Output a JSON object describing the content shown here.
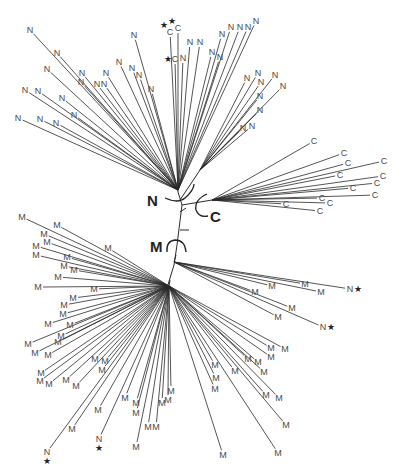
{
  "diagram": {
    "type": "unrooted phylogenetic tree",
    "clade_labels": [
      {
        "label": "N",
        "x": 147,
        "y": 206
      },
      {
        "label": "C",
        "x": 210,
        "y": 222
      },
      {
        "label": "M",
        "x": 152,
        "y": 252
      }
    ],
    "trunk": [
      [
        178,
        192
      ],
      [
        182,
        205
      ],
      [
        177,
        245
      ],
      [
        174,
        265
      ],
      [
        167,
        288
      ]
    ],
    "hubs": {
      "N_upper": {
        "x": 178,
        "y": 190
      },
      "N_right": {
        "x": 200,
        "y": 170
      },
      "C": {
        "x": 212,
        "y": 200
      },
      "M_upper": {
        "x": 169,
        "y": 286
      },
      "M_right": {
        "x": 174,
        "y": 262
      }
    },
    "leaves": [
      {
        "label": "N",
        "x": 30,
        "y": 30,
        "hub": "N_upper"
      },
      {
        "label": "N",
        "x": 57,
        "y": 53,
        "hub": "N_upper"
      },
      {
        "label": "N",
        "x": 47,
        "y": 69,
        "hub": "N_upper"
      },
      {
        "label": "N",
        "x": 82,
        "y": 73,
        "hub": "N_upper"
      },
      {
        "label": "N",
        "x": 81,
        "y": 82,
        "hub": "N_upper"
      },
      {
        "label": "N",
        "x": 106,
        "y": 73,
        "hub": "N_upper"
      },
      {
        "label": "N",
        "x": 97,
        "y": 84,
        "hub": "N_upper"
      },
      {
        "label": "N",
        "x": 104,
        "y": 84,
        "hub": "N_upper"
      },
      {
        "label": "N",
        "x": 25,
        "y": 90,
        "hub": "N_upper"
      },
      {
        "label": "N",
        "x": 38,
        "y": 91,
        "hub": "N_upper"
      },
      {
        "label": "N",
        "x": 62,
        "y": 98,
        "hub": "N_upper"
      },
      {
        "label": "N",
        "x": 74,
        "y": 115,
        "hub": "N_upper"
      },
      {
        "label": "N",
        "x": 18,
        "y": 118,
        "hub": "N_upper"
      },
      {
        "label": "N",
        "x": 40,
        "y": 119,
        "hub": "N_upper"
      },
      {
        "label": "N",
        "x": 56,
        "y": 123,
        "hub": "N_upper"
      },
      {
        "label": "N",
        "x": 119,
        "y": 62,
        "hub": "N_upper"
      },
      {
        "label": "N",
        "x": 132,
        "y": 68,
        "hub": "N_upper"
      },
      {
        "label": "N",
        "x": 139,
        "y": 75,
        "hub": "N_upper"
      },
      {
        "label": "N",
        "x": 134,
        "y": 35,
        "hub": "N_upper"
      },
      {
        "label": "N",
        "x": 151,
        "y": 89,
        "hub": "N_upper"
      },
      {
        "label": "C",
        "x": 170,
        "y": 32,
        "hub": "N_upper",
        "star": true
      },
      {
        "label": "C",
        "x": 178,
        "y": 28,
        "hub": "N_upper",
        "star": true
      },
      {
        "label": "C",
        "x": 175,
        "y": 59,
        "hub": "N_upper",
        "star": true
      },
      {
        "label": "N",
        "x": 183,
        "y": 58,
        "hub": "N_upper"
      },
      {
        "label": "N",
        "x": 190,
        "y": 42,
        "hub": "N_upper"
      },
      {
        "label": "N",
        "x": 200,
        "y": 42,
        "hub": "N_upper"
      },
      {
        "label": "N",
        "x": 212,
        "y": 52,
        "hub": "N_upper"
      },
      {
        "label": "N",
        "x": 220,
        "y": 57,
        "hub": "N_upper"
      },
      {
        "label": "N",
        "x": 222,
        "y": 34,
        "hub": "N_upper"
      },
      {
        "label": "N",
        "x": 231,
        "y": 27,
        "hub": "N_upper"
      },
      {
        "label": "N",
        "x": 240,
        "y": 27,
        "hub": "N_upper"
      },
      {
        "label": "N",
        "x": 248,
        "y": 27,
        "hub": "N_upper"
      },
      {
        "label": "N",
        "x": 256,
        "y": 21,
        "hub": "N_upper"
      },
      {
        "label": "N",
        "x": 247,
        "y": 78,
        "hub": "N_right"
      },
      {
        "label": "N",
        "x": 258,
        "y": 73,
        "hub": "N_right"
      },
      {
        "label": "N",
        "x": 261,
        "y": 82,
        "hub": "N_right"
      },
      {
        "label": "N",
        "x": 275,
        "y": 75,
        "hub": "N_right"
      },
      {
        "label": "N",
        "x": 283,
        "y": 86,
        "hub": "N_right"
      },
      {
        "label": "N",
        "x": 260,
        "y": 96,
        "hub": "N_right"
      },
      {
        "label": "N",
        "x": 260,
        "y": 110,
        "hub": "N_right"
      },
      {
        "label": "N",
        "x": 243,
        "y": 128,
        "hub": "N_right"
      },
      {
        "label": "N",
        "x": 252,
        "y": 126,
        "hub": "N_right"
      },
      {
        "label": "C",
        "x": 314,
        "y": 141,
        "hub": "C"
      },
      {
        "label": "C",
        "x": 344,
        "y": 153,
        "hub": "C"
      },
      {
        "label": "C",
        "x": 348,
        "y": 163,
        "hub": "C"
      },
      {
        "label": "C",
        "x": 384,
        "y": 161,
        "hub": "C"
      },
      {
        "label": "C",
        "x": 340,
        "y": 175,
        "hub": "C"
      },
      {
        "label": "C",
        "x": 383,
        "y": 176,
        "hub": "C"
      },
      {
        "label": "C",
        "x": 377,
        "y": 183,
        "hub": "C"
      },
      {
        "label": "C",
        "x": 353,
        "y": 188,
        "hub": "C"
      },
      {
        "label": "C",
        "x": 375,
        "y": 195,
        "hub": "C"
      },
      {
        "label": "C",
        "x": 322,
        "y": 198,
        "hub": "C"
      },
      {
        "label": "C",
        "x": 330,
        "y": 203,
        "hub": "C"
      },
      {
        "label": "C",
        "x": 286,
        "y": 204,
        "hub": "C"
      },
      {
        "label": "C",
        "x": 320,
        "y": 211,
        "hub": "C"
      },
      {
        "label": "M",
        "x": 22,
        "y": 217,
        "hub": "M_upper"
      },
      {
        "label": "M",
        "x": 57,
        "y": 225,
        "hub": "M_upper"
      },
      {
        "label": "M",
        "x": 44,
        "y": 234,
        "hub": "M_upper"
      },
      {
        "label": "M",
        "x": 36,
        "y": 246,
        "hub": "M_upper"
      },
      {
        "label": "M",
        "x": 47,
        "y": 242,
        "hub": "M_upper"
      },
      {
        "label": "M",
        "x": 36,
        "y": 255,
        "hub": "M_upper"
      },
      {
        "label": "M",
        "x": 108,
        "y": 248,
        "hub": "M_upper"
      },
      {
        "label": "M",
        "x": 67,
        "y": 257,
        "hub": "M_upper"
      },
      {
        "label": "M",
        "x": 64,
        "y": 266,
        "hub": "M_upper"
      },
      {
        "label": "M",
        "x": 74,
        "y": 270,
        "hub": "M_upper"
      },
      {
        "label": "M",
        "x": 58,
        "y": 277,
        "hub": "M_upper"
      },
      {
        "label": "M",
        "x": 38,
        "y": 287,
        "hub": "M_upper"
      },
      {
        "label": "M",
        "x": 94,
        "y": 289,
        "hub": "M_upper"
      },
      {
        "label": "M",
        "x": 73,
        "y": 298,
        "hub": "M_upper"
      },
      {
        "label": "M",
        "x": 64,
        "y": 305,
        "hub": "M_upper"
      },
      {
        "label": "M",
        "x": 63,
        "y": 314,
        "hub": "M_upper"
      },
      {
        "label": "M",
        "x": 48,
        "y": 324,
        "hub": "M_upper"
      },
      {
        "label": "M",
        "x": 70,
        "y": 325,
        "hub": "M_upper"
      },
      {
        "label": "M",
        "x": 61,
        "y": 336,
        "hub": "M_upper"
      },
      {
        "label": "M",
        "x": 28,
        "y": 344,
        "hub": "M_upper"
      },
      {
        "label": "M",
        "x": 58,
        "y": 342,
        "hub": "M_upper"
      },
      {
        "label": "M",
        "x": 35,
        "y": 353,
        "hub": "M_upper"
      },
      {
        "label": "M",
        "x": 48,
        "y": 355,
        "hub": "M_upper"
      },
      {
        "label": "M",
        "x": 95,
        "y": 359,
        "hub": "M_upper"
      },
      {
        "label": "M",
        "x": 105,
        "y": 361,
        "hub": "M_upper"
      },
      {
        "label": "M",
        "x": 102,
        "y": 370,
        "hub": "M_upper"
      },
      {
        "label": "M",
        "x": 41,
        "y": 373,
        "hub": "M_upper"
      },
      {
        "label": "M",
        "x": 40,
        "y": 381,
        "hub": "M_upper"
      },
      {
        "label": "M",
        "x": 49,
        "y": 384,
        "hub": "M_upper"
      },
      {
        "label": "M",
        "x": 66,
        "y": 380,
        "hub": "M_upper"
      },
      {
        "label": "M",
        "x": 76,
        "y": 386,
        "hub": "M_upper"
      },
      {
        "label": "M",
        "x": 125,
        "y": 398,
        "hub": "M_upper"
      },
      {
        "label": "M",
        "x": 136,
        "y": 403,
        "hub": "M_upper"
      },
      {
        "label": "M",
        "x": 136,
        "y": 413,
        "hub": "M_upper"
      },
      {
        "label": "M",
        "x": 171,
        "y": 391,
        "hub": "M_upper"
      },
      {
        "label": "M",
        "x": 162,
        "y": 403,
        "hub": "M_upper"
      },
      {
        "label": "M",
        "x": 168,
        "y": 400,
        "hub": "M_upper"
      },
      {
        "label": "M",
        "x": 148,
        "y": 427,
        "hub": "M_upper"
      },
      {
        "label": "M",
        "x": 156,
        "y": 427,
        "hub": "M_upper"
      },
      {
        "label": "M",
        "x": 98,
        "y": 410,
        "hub": "M_upper"
      },
      {
        "label": "M",
        "x": 72,
        "y": 429,
        "hub": "M_upper"
      },
      {
        "label": "M",
        "x": 136,
        "y": 447,
        "hub": "M_upper"
      },
      {
        "label": "N",
        "x": 47,
        "y": 452,
        "hub": "M_upper",
        "star": true
      },
      {
        "label": "N",
        "x": 99,
        "y": 439,
        "hub": "M_upper",
        "star": true
      },
      {
        "label": "M",
        "x": 215,
        "y": 365,
        "hub": "M_upper"
      },
      {
        "label": "M",
        "x": 216,
        "y": 378,
        "hub": "M_upper"
      },
      {
        "label": "M",
        "x": 215,
        "y": 389,
        "hub": "M_upper"
      },
      {
        "label": "M",
        "x": 235,
        "y": 371,
        "hub": "M_upper"
      },
      {
        "label": "M",
        "x": 248,
        "y": 359,
        "hub": "M_upper"
      },
      {
        "label": "M",
        "x": 258,
        "y": 362,
        "hub": "M_upper"
      },
      {
        "label": "M",
        "x": 271,
        "y": 348,
        "hub": "M_upper"
      },
      {
        "label": "M",
        "x": 271,
        "y": 357,
        "hub": "M_upper"
      },
      {
        "label": "M",
        "x": 285,
        "y": 349,
        "hub": "M_upper"
      },
      {
        "label": "M",
        "x": 264,
        "y": 372,
        "hub": "M_upper"
      },
      {
        "label": "M",
        "x": 266,
        "y": 395,
        "hub": "M_upper"
      },
      {
        "label": "M",
        "x": 279,
        "y": 398,
        "hub": "M_upper"
      },
      {
        "label": "M",
        "x": 286,
        "y": 425,
        "hub": "M_upper"
      },
      {
        "label": "M",
        "x": 223,
        "y": 455,
        "hub": "M_upper"
      },
      {
        "label": "M",
        "x": 278,
        "y": 453,
        "hub": "M_upper"
      },
      {
        "label": "M",
        "x": 255,
        "y": 292,
        "hub": "M_right"
      },
      {
        "label": "M",
        "x": 272,
        "y": 286,
        "hub": "M_right"
      },
      {
        "label": "M",
        "x": 305,
        "y": 284,
        "hub": "M_right"
      },
      {
        "label": "M",
        "x": 321,
        "y": 292,
        "hub": "M_right"
      },
      {
        "label": "M",
        "x": 292,
        "y": 308,
        "hub": "M_right"
      },
      {
        "label": "M",
        "x": 278,
        "y": 317,
        "hub": "M_right"
      },
      {
        "label": "N",
        "x": 350,
        "y": 289,
        "hub": "M_right",
        "star": true
      },
      {
        "label": "N",
        "x": 323,
        "y": 327,
        "hub": "M_right",
        "star": true
      }
    ]
  }
}
